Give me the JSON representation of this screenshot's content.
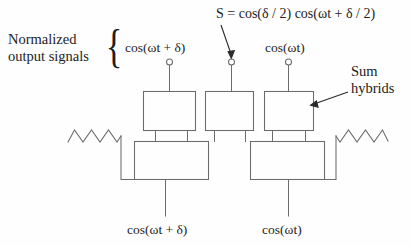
{
  "diagram": {
    "title_formula": "S = cos(δ / 2) cos(ωt + δ / 2)",
    "labels": {
      "normalized_line1": "Normalized",
      "normalized_line2": "output signals",
      "brace": "{",
      "output_left": "cos(ωt + δ)",
      "output_right": "cos(ωt)",
      "sum_line1": "Sum",
      "sum_line2": "hybrids",
      "input_left": "cos(ωt + δ)",
      "input_right": "cos(ωt)"
    },
    "colors": {
      "line": "#6b6b6b",
      "text": "#1c1c1c",
      "background": "#fefefe",
      "arrow": "#2a2a2a"
    },
    "components": {
      "hybrid_boxes": [
        {
          "name": "sum-hybrid-left",
          "x": 143,
          "y": 91,
          "w": 52,
          "h": 39
        },
        {
          "name": "sum-hybrid-middle",
          "x": 205,
          "y": 91,
          "w": 48,
          "h": 39
        },
        {
          "name": "sum-hybrid-right",
          "x": 264,
          "y": 91,
          "w": 49,
          "h": 39
        }
      ],
      "lower_boxes": [
        {
          "name": "divider-left",
          "x": 134,
          "y": 141,
          "w": 74,
          "h": 38
        },
        {
          "name": "divider-right",
          "x": 250,
          "y": 141,
          "w": 74,
          "h": 38
        }
      ],
      "terminals": [
        {
          "name": "output-terminal-left",
          "cx": 169,
          "cy": 62,
          "r": 3
        },
        {
          "name": "output-terminal-middle",
          "cx": 231,
          "cy": 62,
          "r": 3
        },
        {
          "name": "output-terminal-right",
          "cx": 288,
          "cy": 62,
          "r": 3
        }
      ],
      "terminations": [
        {
          "name": "termination-left-zigzag",
          "x_start": 68,
          "x_end": 121,
          "y": 136
        },
        {
          "name": "termination-right-zigzag",
          "x_start": 336,
          "x_end": 388,
          "y": 136
        }
      ]
    }
  }
}
